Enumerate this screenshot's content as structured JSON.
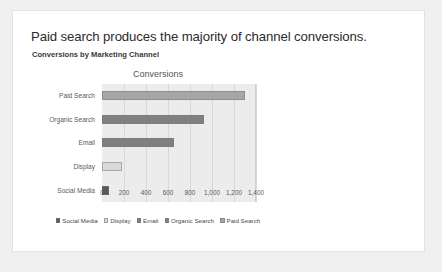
{
  "slide": {
    "title": "Paid search produces the majority of channel conversions.",
    "subtitle": "Conversions by Marketing Channel"
  },
  "chart_data": {
    "type": "bar",
    "orientation": "horizontal",
    "title": "Conversions",
    "xlabel": "",
    "ylabel": "",
    "categories": [
      "Paid Search",
      "Organic Search",
      "Email",
      "Display",
      "Social Media"
    ],
    "values": [
      1300,
      930,
      650,
      180,
      60
    ],
    "colors": [
      "#a6a6a6",
      "#808080",
      "#808080",
      "#d9d9d9",
      "#595959"
    ],
    "xlim": [
      0,
      1400
    ],
    "xticks": [
      0,
      200,
      400,
      600,
      800,
      1000,
      1200,
      1400
    ],
    "xtick_labels": [
      "0",
      "200",
      "400",
      "600",
      "800",
      "1,000",
      "1,200",
      "1,400"
    ],
    "grid": true,
    "legend_position": "bottom",
    "legend": [
      {
        "label": "Social Media",
        "color": "#595959"
      },
      {
        "label": "Display",
        "color": "#d9d9d9"
      },
      {
        "label": "Email",
        "color": "#808080"
      },
      {
        "label": "Organic Search",
        "color": "#808080"
      },
      {
        "label": "Paid Search",
        "color": "#a6a6a6"
      }
    ],
    "plot_background": "#ececec"
  }
}
